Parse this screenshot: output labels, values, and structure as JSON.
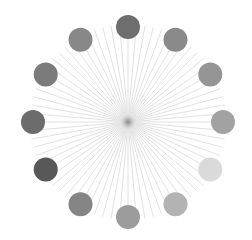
{
  "figure": {
    "center": [
      128,
      122
    ],
    "ray_count": 72,
    "ray_length": 98,
    "ray_color": "#d9d9d9",
    "hub_color": "#9a9a9a",
    "circle_radius": 12,
    "ring_radius": 95,
    "circles": [
      {
        "position": "12 o'clock",
        "color": "#6e6e6e"
      },
      {
        "position": "1 o'clock",
        "color": "#8a8a8a"
      },
      {
        "position": "2 o'clock",
        "color": "#959595"
      },
      {
        "position": "3 o'clock",
        "color": "#a2a2a2"
      },
      {
        "position": "4 o'clock",
        "color": "#dadada"
      },
      {
        "position": "5 o'clock",
        "color": "#b3b3b3"
      },
      {
        "position": "6 o'clock",
        "color": "#9c9c9c"
      },
      {
        "position": "7 o'clock",
        "color": "#858585"
      },
      {
        "position": "8 o'clock",
        "color": "#585858"
      },
      {
        "position": "9 o'clock",
        "color": "#6c6c6c"
      },
      {
        "position": "10 o'clock",
        "color": "#7b7b7b"
      },
      {
        "position": "11 o'clock",
        "color": "#888888"
      }
    ]
  }
}
